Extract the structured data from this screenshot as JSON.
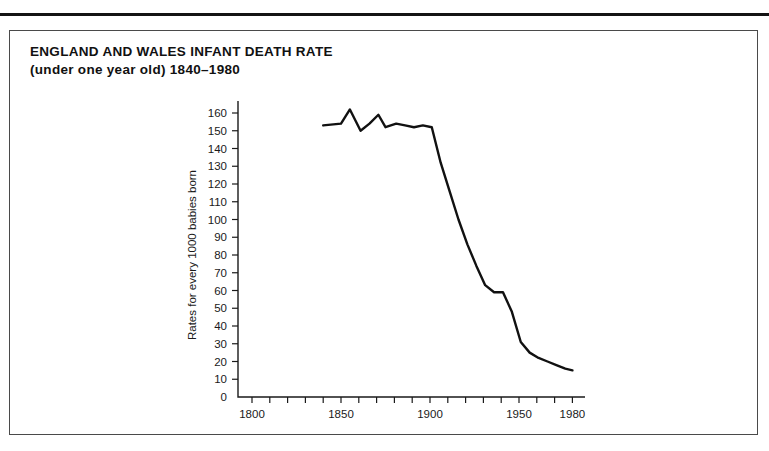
{
  "figure": {
    "title": "ENGLAND AND WALES INFANT DEATH RATE",
    "subtitle": "(under one year old) 1840–1980"
  },
  "chart_data": {
    "type": "line",
    "xlabel": "",
    "ylabel": "Rates for every 1000 babies born",
    "xlim": [
      1785,
      1985
    ],
    "ylim": [
      0,
      165
    ],
    "grid": false,
    "legend": null,
    "x_tick_labels": [
      "1800",
      "1850",
      "1900",
      "1950",
      "1980"
    ],
    "x_tick_values": [
      1800,
      1850,
      1900,
      1950,
      1980
    ],
    "x_minor_tick_step": 10,
    "y_tick_labels": [
      "0",
      "10",
      "20",
      "30",
      "40",
      "50",
      "60",
      "70",
      "80",
      "90",
      "100",
      "110",
      "120",
      "130",
      "140",
      "150",
      "160"
    ],
    "y_tick_values": [
      0,
      10,
      20,
      30,
      40,
      50,
      60,
      70,
      80,
      90,
      100,
      110,
      120,
      130,
      140,
      150,
      160
    ],
    "series": [
      {
        "name": "Infant death rate",
        "x": [
          1840,
          1850,
          1855,
          1861,
          1866,
          1871,
          1875,
          1881,
          1886,
          1891,
          1896,
          1901,
          1906,
          1911,
          1916,
          1921,
          1926,
          1931,
          1936,
          1941,
          1946,
          1951,
          1956,
          1961,
          1966,
          1971,
          1976,
          1980
        ],
        "values": [
          153,
          154,
          162,
          150,
          154,
          159,
          152,
          154,
          153,
          152,
          153,
          152,
          132,
          116,
          100,
          86,
          74,
          63,
          59,
          59,
          48,
          31,
          25,
          22,
          20,
          18,
          16,
          15
        ]
      }
    ]
  }
}
